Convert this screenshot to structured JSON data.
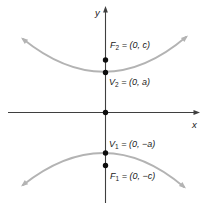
{
  "figure": {
    "axes": {
      "x_label": "x",
      "y_label": "y"
    },
    "labels": {
      "f2": {
        "letter": "F",
        "sub": "2",
        "rest": " = (0, c)"
      },
      "v2": {
        "letter": "V",
        "sub": "2",
        "rest": " = (0, a)"
      },
      "v1": {
        "letter": "V",
        "sub": "1",
        "rest": " = (0, −a)"
      },
      "f1": {
        "letter": "F",
        "sub": "1",
        "rest": " = (0, −c)"
      }
    },
    "colors": {
      "background": "#ffffff",
      "axis": "#3f3f3f",
      "curve": "#b3b3b3",
      "dot": "#0d0d0d",
      "text": "#1a1a1a"
    }
  }
}
